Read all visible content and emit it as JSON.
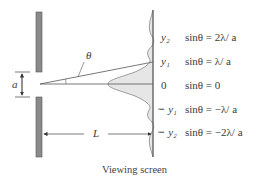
{
  "diagram": {
    "caption": "Viewing screen",
    "slit_width_label": "a",
    "distance_label": "L",
    "angle_label": "θ",
    "positions": [
      {
        "label": "y₂",
        "equation": "sinθ = 2λ/ a"
      },
      {
        "label": "y₁",
        "equation": "sinθ = λ/ a"
      },
      {
        "label": "0",
        "equation": "sinθ = 0"
      },
      {
        "label": "− y₁",
        "equation": "sinθ = −λ/ a"
      },
      {
        "label": "− y₂",
        "equation": "sinθ = −2λ/ a"
      }
    ],
    "colors": {
      "slit_fill": "#8a8a8a",
      "curve_fill": "#e6e6e6",
      "line": "#555555"
    }
  }
}
